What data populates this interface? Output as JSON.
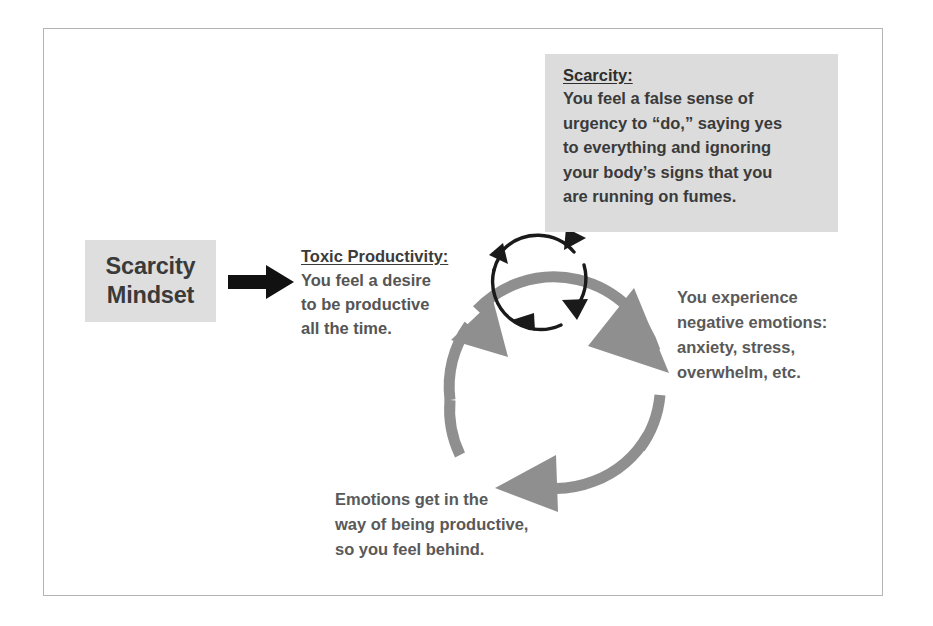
{
  "diagram": {
    "frame": {
      "border_color": "#b4b4b4",
      "background": "#ffffff"
    },
    "colors": {
      "chip_background": "#dedede",
      "callout_background": "#dcdcdc",
      "cycle_outer_arrow": "#8f8f8f",
      "cycle_inner_arrow": "#1a1a1a",
      "straight_arrow": "#111111",
      "body_text": "#595959",
      "heading_text": "#333333"
    },
    "start_label": {
      "line1": "Scarcity",
      "line2": "Mindset"
    },
    "flow_arrow": {
      "icon": "right-arrow-icon",
      "direction": "right"
    },
    "nodes": [
      {
        "id": "toxic-productivity",
        "heading": "Toxic Productivity:",
        "lines": [
          "You feel a desire",
          "to be productive",
          "all the time."
        ]
      },
      {
        "id": "negative-emotions",
        "heading": "",
        "lines": [
          "You experience",
          "negative emotions:",
          "anxiety, stress,",
          "overwhelm, etc."
        ]
      },
      {
        "id": "feel-behind",
        "heading": "",
        "lines": [
          "Emotions get in the",
          "way of being productive,",
          "so you feel behind."
        ]
      }
    ],
    "callout": {
      "heading": "Scarcity:",
      "lines": [
        "You feel a false sense of",
        "urgency to “do,” saying yes",
        "to everything and ignoring",
        "your body’s signs that you",
        "are running on fumes."
      ]
    },
    "cycle": {
      "outer": {
        "icon": "circular-arrow-cycle-icon",
        "direction": "clockwise",
        "segments": 3,
        "color": "#8f8f8f"
      },
      "inner": {
        "icon": "circular-arrow-cycle-icon",
        "direction": "clockwise",
        "segments": 3,
        "color": "#1a1a1a"
      }
    }
  }
}
